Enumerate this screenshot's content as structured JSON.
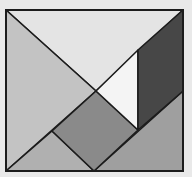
{
  "diagram": {
    "type": "tangram-square",
    "outer_square": {
      "x": 6,
      "y": 10,
      "width": 177,
      "height": 161
    },
    "background": "#e9e9e9",
    "stroke_color": "#1c1c1c",
    "pieces": [
      {
        "id": "large-triangle-top",
        "shape": "triangle",
        "color": "#e4e4e4",
        "points": "6,10 183,10 96,91"
      },
      {
        "id": "large-triangle-left",
        "shape": "triangle",
        "color": "#c3c3c3",
        "points": "6,10 96,91 6,171"
      },
      {
        "id": "medium-triangle-bottom-right",
        "shape": "triangle",
        "color": "#9f9f9f",
        "points": "183,91 183,171 94,171"
      },
      {
        "id": "small-triangle-bottom",
        "shape": "triangle",
        "color": "#b0b0b0",
        "points": "6,171 52,131 94,171"
      },
      {
        "id": "square-center",
        "shape": "square",
        "color": "#8a8a8a",
        "points": "96,91 138,130 94,171 52,131"
      },
      {
        "id": "small-triangle-white",
        "shape": "triangle",
        "color": "#f4f4f4",
        "points": "96,91 138,50 138,130"
      },
      {
        "id": "parallelogram-dark",
        "shape": "parallelogram",
        "color": "#474747",
        "points": "183,10 183,91 138,130 138,50"
      }
    ]
  }
}
